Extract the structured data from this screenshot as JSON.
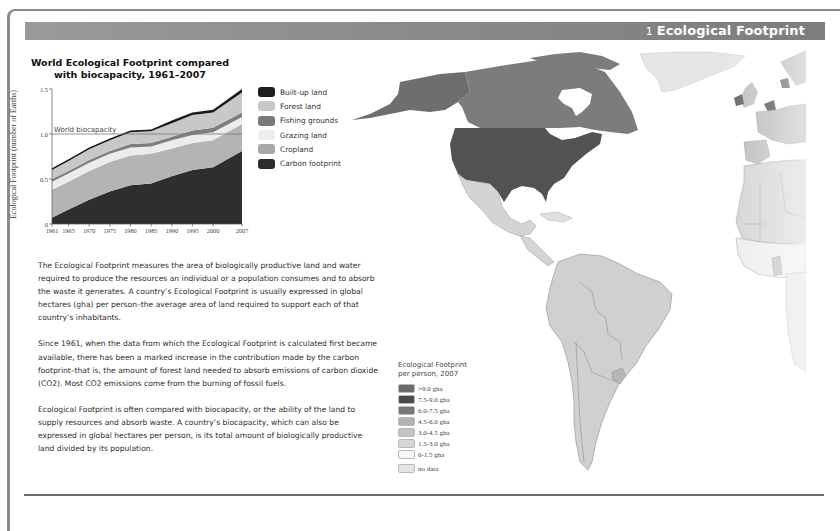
{
  "header": {
    "section_number": "1",
    "section_title": "Ecological Footprint",
    "bar_color": "#8c8c8c"
  },
  "chart_data": {
    "type": "area",
    "stacked": true,
    "title_line1": "World Ecological Footprint compared",
    "title_line2": "with biocapacity, 1961–2007",
    "xlabel": "",
    "ylabel": "Ecological Footprint (number of Earths)",
    "ylim": [
      0,
      1.5
    ],
    "yticks": [
      "0",
      "0.5",
      "1.0",
      "1.5"
    ],
    "xticks": [
      "1961",
      "1965",
      "1970",
      "1975",
      "1980",
      "1985",
      "1990",
      "1995",
      "2000",
      "2007"
    ],
    "x": [
      1961,
      1965,
      1970,
      1975,
      1980,
      1985,
      1990,
      1995,
      2000,
      2007
    ],
    "reference_line": {
      "label": "World biocapacity",
      "value": 1.0
    },
    "grid": false,
    "legend_position": "right",
    "series": [
      {
        "name": "Carbon footprint",
        "color": "#2e2e2e",
        "values": [
          0.07,
          0.16,
          0.27,
          0.36,
          0.43,
          0.45,
          0.53,
          0.6,
          0.63,
          0.81
        ]
      },
      {
        "name": "Cropland",
        "color": "#b4b4b4",
        "values": [
          0.31,
          0.31,
          0.32,
          0.33,
          0.33,
          0.33,
          0.31,
          0.3,
          0.3,
          0.3
        ]
      },
      {
        "name": "Grazing land",
        "color": "#ececec",
        "values": [
          0.09,
          0.09,
          0.09,
          0.09,
          0.09,
          0.08,
          0.09,
          0.09,
          0.09,
          0.08
        ]
      },
      {
        "name": "Fishing grounds",
        "color": "#7e7e7e",
        "values": [
          0.03,
          0.03,
          0.03,
          0.03,
          0.04,
          0.04,
          0.04,
          0.05,
          0.05,
          0.05
        ]
      },
      {
        "name": "Forest land",
        "color": "#c8c8c8",
        "values": [
          0.1,
          0.11,
          0.12,
          0.12,
          0.13,
          0.13,
          0.15,
          0.17,
          0.17,
          0.22
        ]
      },
      {
        "name": "Built-up land",
        "color": "#1a1a1a",
        "values": [
          0.02,
          0.02,
          0.02,
          0.02,
          0.02,
          0.02,
          0.03,
          0.03,
          0.03,
          0.04
        ]
      }
    ]
  },
  "chart_legend": [
    {
      "label": "Built-up land",
      "color": "#1e1e1e"
    },
    {
      "label": "Forest land",
      "color": "#c8c8c8"
    },
    {
      "label": "Fishing grounds",
      "color": "#7a7a7a"
    },
    {
      "label": "Grazing land",
      "color": "#ededed"
    },
    {
      "label": "Cropland",
      "color": "#a8a8a8"
    },
    {
      "label": "Carbon footprint",
      "color": "#2c2c2c"
    }
  ],
  "body": {
    "paragraphs": [
      "The Ecological Footprint measures the area of biologically productive land and water required to produce the resources an individual or a population consumes and to absorb the waste it generates. A country’s Ecological Footprint is usually expressed in global hectares (gha) per person–the average area of land required to support each of that country’s inhabitants.",
      "Since 1961, when the data from which the Ecological Footprint is calculated first became available, there has been a marked increase in the contribution made by the carbon footprint–that is, the amount of forest land needed to absorb emissions of carbon dioxide (CO2). Most CO2 emissions come from the burning of fossil fuels.",
      "Ecological Footprint is often compared with biocapacity, or the ability of the land to supply resources and absorb waste. A country’s biocapacity, which can also be expressed in global hectares per person, is its total amount of biologically productive land divided by its population."
    ]
  },
  "map_legend": {
    "title_line1": "Ecological Footprint",
    "title_line2": "per person, 2007",
    "items": [
      {
        "label": ">9.0 gha",
        "color": "#6a6a6a"
      },
      {
        "label": "7.5-9.0 gha",
        "color": "#4a4a4a"
      },
      {
        "label": "6.0-7.5 gha",
        "color": "#777777"
      },
      {
        "label": "4.5-6.0 gha",
        "color": "#b2b2b2"
      },
      {
        "label": "3.0-4.5 gha",
        "color": "#c4c4c4"
      },
      {
        "label": "1.5-3.0 gha",
        "color": "#d6d6d6"
      },
      {
        "label": "0-1.5 gha",
        "color": "#f7f7f7"
      },
      {
        "label": "no data",
        "color": "#e4e4e4"
      }
    ]
  }
}
